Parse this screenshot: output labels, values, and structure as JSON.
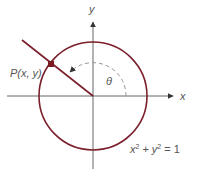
{
  "diagram": {
    "type": "unit-circle",
    "axes": {
      "x_label": "x",
      "y_label": "y"
    },
    "point_label": "P(x, y)",
    "angle_label": "θ",
    "equation": {
      "x": "x",
      "x_exp": "2",
      "plus": "+",
      "y": "y",
      "y_exp": "2",
      "equals": "=",
      "rhs": "1"
    },
    "colors": {
      "circle": "#7a1f2b",
      "axis": "#555555",
      "point": "#7a1a22",
      "dashed_arc": "#999999",
      "text": "#555555"
    }
  }
}
